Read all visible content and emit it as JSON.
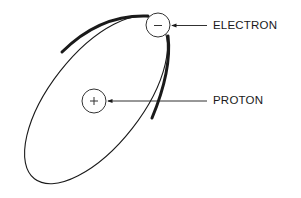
{
  "diagram": {
    "type": "atom-model",
    "labels": {
      "electron": "ELECTRON",
      "proton": "PROTON"
    },
    "symbols": {
      "electron": "−",
      "proton": "+"
    },
    "colors": {
      "stroke": "#1a1a1a",
      "background": "#ffffff"
    }
  }
}
